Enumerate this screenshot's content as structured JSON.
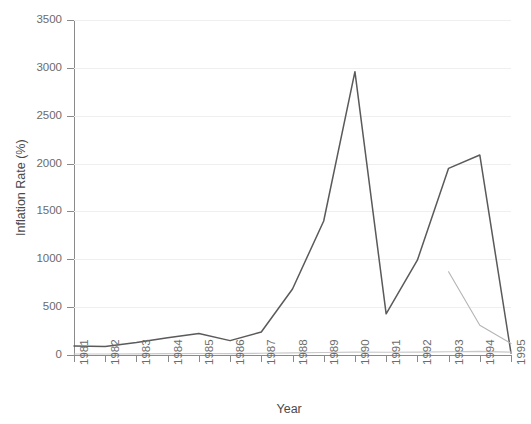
{
  "chart_data": {
    "type": "line",
    "title": "",
    "xlabel": "Year",
    "ylabel": "Inflation Rate (%)",
    "categories": [
      "1981",
      "1982",
      "1983",
      "1984",
      "1985",
      "1986",
      "1987",
      "1988",
      "1989",
      "1990",
      "1991",
      "1992",
      "1993",
      "1994",
      "1995"
    ],
    "x": [
      1981,
      1982,
      1983,
      1984,
      1985,
      1986,
      1987,
      1988,
      1989,
      1990,
      1991,
      1992,
      1993,
      1994,
      1995
    ],
    "xlim": [
      1981,
      1995
    ],
    "ylim": [
      0,
      3500
    ],
    "yticks": [
      0,
      500,
      1000,
      1500,
      2000,
      2500,
      3000,
      3500
    ],
    "ytick_labels": [
      "0",
      "500",
      "1000",
      "1500",
      "2000",
      "2500",
      "3000",
      "3500"
    ],
    "grid": true,
    "legend": "none",
    "series": [
      {
        "name": "series-1",
        "color": "#5a5a5a",
        "values": [
          95,
          90,
          130,
          180,
          225,
          150,
          240,
          690,
          1400,
          2960,
          430,
          990,
          1950,
          2090,
          20
        ]
      },
      {
        "name": "series-2",
        "color": "#b4b4b4",
        "values": [
          null,
          null,
          null,
          null,
          null,
          null,
          null,
          null,
          null,
          null,
          null,
          null,
          870,
          310,
          120
        ]
      },
      {
        "name": "series-3",
        "color": "#c8c8c8",
        "values": [
          10,
          10,
          12,
          14,
          16,
          14,
          18,
          22,
          26,
          30,
          28,
          30,
          34,
          38,
          30
        ]
      }
    ]
  },
  "axis": {
    "y_title": "Inflation Rate (%)",
    "x_title": "Year"
  }
}
